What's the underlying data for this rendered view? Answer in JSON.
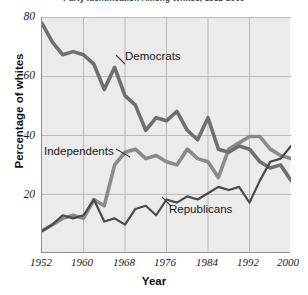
{
  "figure": {
    "title": "Party Identification Among Whites, 1952-2000",
    "title_clipped": true
  },
  "axes": {
    "ylabel": "Percentage of whites",
    "xlabel": "Year",
    "yticks": [
      "20",
      "40",
      "60",
      "80"
    ],
    "xticks": [
      "1952",
      "1960",
      "1968",
      "1976",
      "1984",
      "1992",
      "2000"
    ]
  },
  "annotations": {
    "democrats": "Democrats",
    "independents": "Independents",
    "republicans": "Republicans"
  },
  "colors": {
    "plot_background": "#ebebe9",
    "page_background": "#ffffff",
    "gridline": "#b9b9b7",
    "axis": "#8e8e8e",
    "democrats": "#6f6f6f",
    "independents": "#8a8a8a",
    "republicans": "#4a4a4a",
    "text": "#1a1a1a"
  },
  "chart_data": {
    "type": "line",
    "title": "Party Identification Among Whites, 1952-2000",
    "xlabel": "Year",
    "ylabel": "Percentage of whites",
    "xlim": [
      1952,
      2000
    ],
    "ylim": [
      5,
      80
    ],
    "yticks": [
      20,
      40,
      60,
      80
    ],
    "xticks": [
      1952,
      1960,
      1968,
      1976,
      1984,
      1992,
      2000
    ],
    "grid": true,
    "legend": "inline-annotations",
    "x": [
      1952,
      1954,
      1956,
      1958,
      1960,
      1962,
      1964,
      1966,
      1968,
      1970,
      1972,
      1974,
      1976,
      1978,
      1980,
      1982,
      1984,
      1986,
      1988,
      1990,
      1992,
      1994,
      1996,
      1998,
      2000
    ],
    "series": [
      {
        "name": "Democrats",
        "color": "#6f6f6f",
        "values": [
          78,
          72,
          68,
          69,
          68,
          65,
          57,
          64,
          55,
          52,
          44,
          48,
          47,
          50,
          44,
          41,
          48,
          38,
          37,
          39,
          38,
          34,
          32,
          33,
          28
        ]
      },
      {
        "name": "Independents",
        "color": "#8a8a8a",
        "values": [
          12,
          14,
          16,
          17,
          16,
          22,
          20,
          33,
          37,
          38,
          35,
          36,
          34,
          33,
          38,
          35,
          34,
          29,
          38,
          40,
          42,
          42,
          38,
          36,
          35
        ]
      },
      {
        "name": "Republicans",
        "color": "#4a4a4a",
        "values": [
          12,
          14,
          17,
          16,
          17,
          22,
          15,
          16,
          14,
          19,
          20,
          17,
          22,
          21,
          23,
          22,
          24,
          26,
          25,
          26,
          21,
          28,
          34,
          35,
          39
        ]
      }
    ]
  }
}
